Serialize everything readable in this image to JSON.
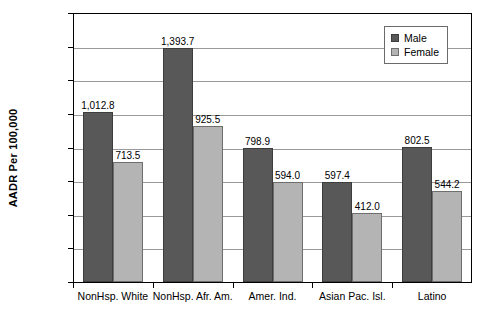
{
  "chart_data": {
    "type": "bar",
    "title": "",
    "subtitle": "",
    "xlabel": "",
    "ylabel": "AADR Per 100,000",
    "ylim": [
      0,
      1600
    ],
    "ytick_step": 200,
    "ytick_labels": [
      "0.0",
      "200.0",
      "400.0",
      "600.0",
      "800.0",
      "1,000.0",
      "1,200.0",
      "1,400.0",
      "1,600.0"
    ],
    "ytick_values": [
      0,
      200,
      400,
      600,
      800,
      1000,
      1200,
      1400,
      1600
    ],
    "grid": "horizontal",
    "legend_position": "top-right-inside",
    "categories": [
      "NonHsp. White",
      "NonHsp. Afr. Am.",
      "Amer. Ind.",
      "Asian Pac. Isl.",
      "Latino"
    ],
    "series": [
      {
        "name": "Male",
        "color": "#585858",
        "values": [
          1012.8,
          798.9,
          597.4,
          802.5,
          1393.7
        ],
        "values_ordered": [
          1012.8,
          1393.7,
          798.9,
          597.4,
          802.5
        ],
        "labels": [
          "1,012.8",
          "1,393.7",
          "798.9",
          "597.4",
          "802.5"
        ]
      },
      {
        "name": "Female",
        "color": "#b4b4b4",
        "values_ordered": [
          713.5,
          925.5,
          594.0,
          412.0,
          544.2
        ],
        "labels": [
          "713.5",
          "925.5",
          "594.0",
          "412.0",
          "544.2"
        ]
      }
    ]
  },
  "legend": {
    "items": [
      {
        "label": "Male",
        "swatch": "male"
      },
      {
        "label": "Female",
        "swatch": "female"
      }
    ]
  },
  "axis": {
    "y_title": "AADR Per 100,000"
  }
}
